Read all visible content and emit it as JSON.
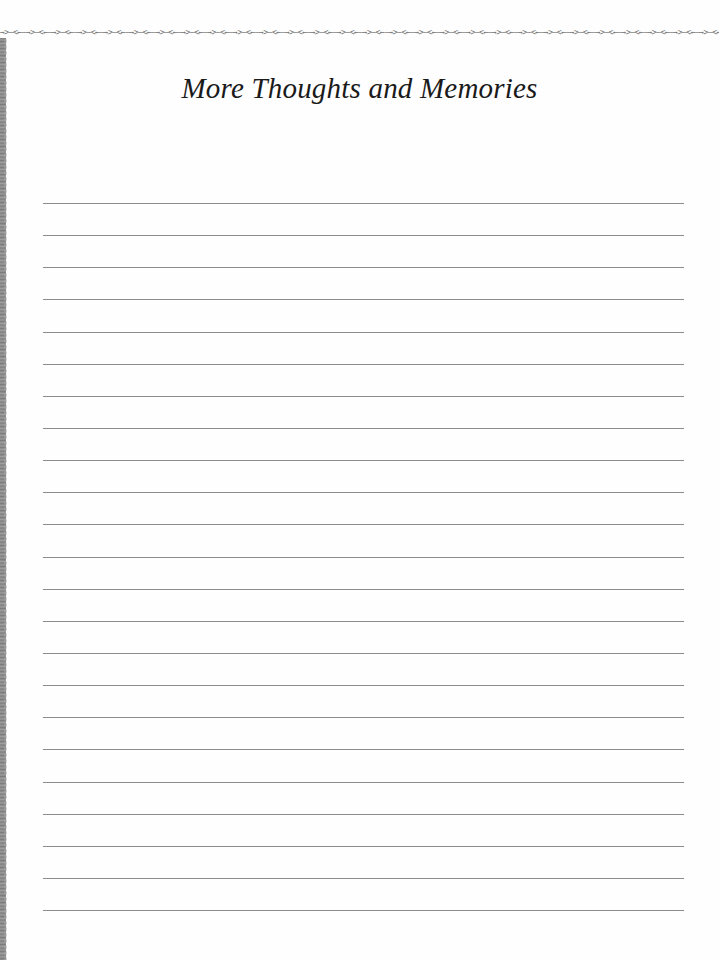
{
  "page": {
    "title": "More Thoughts and Memories",
    "top_border_pattern": "→>–<←–→>–<←–",
    "ruled_lines": {
      "count": 23,
      "first_y": 203,
      "spacing": 32.14,
      "left": 43,
      "right": 684,
      "color": "#8c8c8c"
    }
  }
}
